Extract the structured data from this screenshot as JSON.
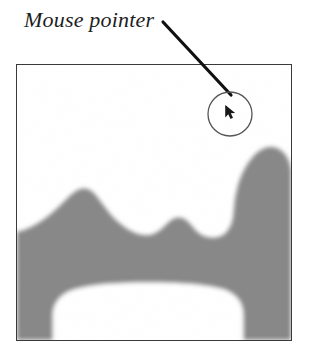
{
  "figure": {
    "width": 309,
    "height": 353,
    "background_color": "#ffffff",
    "annotation": {
      "label": "Mouse pointer",
      "text_color": "#1d1d1d",
      "leader_line": {
        "from_x": 163,
        "from_y": 22,
        "to_x": 231,
        "to_y": 95,
        "color": "#111111",
        "width": 3
      }
    },
    "screen": {
      "x": 16,
      "y": 64,
      "width": 276,
      "height": 277,
      "border_color": "#3a3a3a",
      "fill_color": "#ffffff",
      "blob_color": "#888888",
      "blob_label": "grayscale-shape"
    },
    "cursor_callout": {
      "circle_center_x": 230,
      "circle_center_y": 114,
      "circle_radius": 22,
      "circle_stroke_color": "#555555",
      "cursor_icon_name": "mouse-pointer-icon",
      "cursor_color": "#1a1a1a"
    }
  },
  "colors": {
    "gray_fill": "#888888",
    "ink": "#1d1d1d",
    "frame": "#3a3a3a",
    "page": "#ffffff"
  }
}
